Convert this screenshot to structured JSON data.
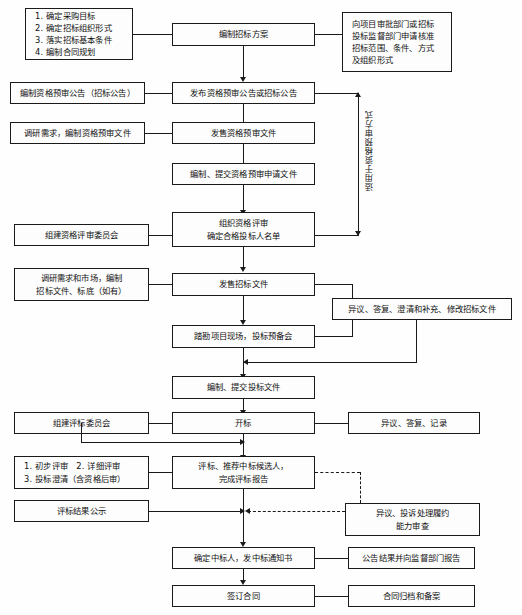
{
  "diagram": {
    "colors": {
      "line": "#1a1a1a",
      "box_fill": "#fdfdfd",
      "background": "#fefefe",
      "text": "#111111"
    },
    "vertical_label": "适用于资格预审方式",
    "nodes": {
      "purchase_goals": {
        "lines": [
          "1. 确定采购目标",
          "2. 确定招标组织形式",
          "3. 落实招标基本条件",
          "4. 编制合同规划"
        ]
      },
      "tender_plan": {
        "lines": [
          "编制招标方案"
        ]
      },
      "approval_apply": {
        "lines": [
          "向项目审批部门或招标",
          "投标监督部门申请核准",
          "招标范围、条件、方式",
          "及组织形式"
        ]
      },
      "prepare_prequal_notice": {
        "lines": [
          "编制资格预审公告（招标公告）"
        ]
      },
      "publish_notice": {
        "lines": [
          "发布资格预审公告或招标公告"
        ]
      },
      "survey_prequal_docs": {
        "lines": [
          "调研需求，编制资格预审文件"
        ]
      },
      "sell_prequal_docs": {
        "lines": [
          "发售资格预审文件"
        ]
      },
      "submit_prequal_app": {
        "lines": [
          "编制、提交资格预审申请文件"
        ]
      },
      "form_prequal_committee": {
        "lines": [
          "组建资格评审委员会"
        ]
      },
      "organize_prequal_review": {
        "lines": [
          "组织资格评审",
          "确定合格投标人名单"
        ]
      },
      "survey_market": {
        "lines": [
          "调研需求和市场，编制",
          "招标文件、标底（如有）"
        ]
      },
      "sell_tender_docs": {
        "lines": [
          "发售招标文件"
        ]
      },
      "objection_clarify": {
        "lines": [
          "异议、答复、澄清和补充、修改招标文件"
        ]
      },
      "site_survey": {
        "lines": [
          "踏勘项目现场，投标预备会"
        ]
      },
      "prepare_bid_docs": {
        "lines": [
          "编制、提交投标文件"
        ]
      },
      "form_eval_committee": {
        "lines": [
          "组建评标委员会"
        ]
      },
      "bid_opening": {
        "lines": [
          "开标"
        ]
      },
      "objection_reply_record": {
        "lines": [
          "异议、答复、记录"
        ]
      },
      "eval_steps": {
        "lines": [
          "1. 初步评审　2. 详细评审",
          "3. 投标澄清（含资格后审）"
        ]
      },
      "eval_recommend": {
        "lines": [
          "评标、推荐中标候选人，",
          "完成评标报告"
        ]
      },
      "eval_result_publicity": {
        "lines": [
          "评标结果公示"
        ]
      },
      "complaint_capability": {
        "lines": [
          "异议、投诉处理履约",
          "能力审查"
        ]
      },
      "determine_winner": {
        "lines": [
          "确定中标人，发中标通知书"
        ]
      },
      "announce_report": {
        "lines": [
          "公告结果并向监督部门报告"
        ]
      },
      "sign_contract": {
        "lines": [
          "签订合同"
        ]
      },
      "archive_contract": {
        "lines": [
          "合同归档和备案"
        ]
      }
    }
  }
}
